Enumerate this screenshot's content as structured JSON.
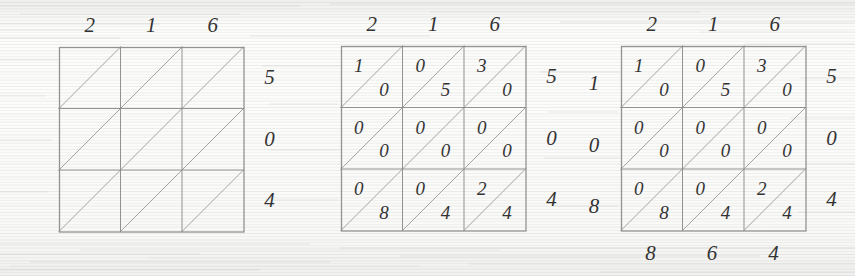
{
  "figure": {
    "type": "lattice-multiplication",
    "multiplicand": "216",
    "multiplier": "504",
    "product": "108864"
  },
  "panels": [
    {
      "id": "panel-empty-lattice",
      "name": "empty-lattice",
      "x": 59,
      "y": 47,
      "cell": 61.5,
      "rows": 3,
      "cols": 3,
      "top_labels": [
        "2",
        "1",
        "6"
      ],
      "right_labels": [
        "5",
        "0",
        "4"
      ],
      "left_labels": [],
      "bottom_labels": [],
      "cells": []
    },
    {
      "id": "panel-filled-lattice",
      "name": "filled-lattice",
      "x": 341,
      "y": 46,
      "cell": 61.5,
      "rows": 3,
      "cols": 3,
      "top_labels": [
        "2",
        "1",
        "6"
      ],
      "right_labels": [
        "5",
        "0",
        "4"
      ],
      "left_labels": [],
      "bottom_labels": [],
      "cells": [
        [
          {
            "tens": "1",
            "units": "0"
          },
          {
            "tens": "0",
            "units": "5"
          },
          {
            "tens": "3",
            "units": "0"
          }
        ],
        [
          {
            "tens": "0",
            "units": "0"
          },
          {
            "tens": "0",
            "units": "0"
          },
          {
            "tens": "0",
            "units": "0"
          }
        ],
        [
          {
            "tens": "0",
            "units": "8"
          },
          {
            "tens": "0",
            "units": "4"
          },
          {
            "tens": "2",
            "units": "4"
          }
        ]
      ]
    },
    {
      "id": "panel-summed-lattice",
      "name": "summed-lattice",
      "x": 621,
      "y": 46,
      "cell": 61.5,
      "rows": 3,
      "cols": 3,
      "top_labels": [
        "2",
        "1",
        "6"
      ],
      "right_labels": [
        "5",
        "0",
        "4"
      ],
      "left_labels": [
        "1",
        "0",
        "8"
      ],
      "bottom_labels": [
        "8",
        "6",
        "4"
      ],
      "cells": [
        [
          {
            "tens": "1",
            "units": "0"
          },
          {
            "tens": "0",
            "units": "5"
          },
          {
            "tens": "3",
            "units": "0"
          }
        ],
        [
          {
            "tens": "0",
            "units": "0"
          },
          {
            "tens": "0",
            "units": "0"
          },
          {
            "tens": "0",
            "units": "0"
          }
        ],
        [
          {
            "tens": "0",
            "units": "8"
          },
          {
            "tens": "0",
            "units": "4"
          },
          {
            "tens": "2",
            "units": "4"
          }
        ]
      ]
    }
  ],
  "colors": {
    "paper": "#fcfcfb",
    "ink": "#333333",
    "rule": "#8d8d8d",
    "diagonal": "#9a9a9a"
  }
}
